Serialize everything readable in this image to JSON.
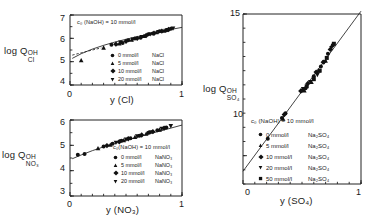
{
  "figure": {
    "ink_color": "#1a1a1a"
  },
  "panels": {
    "cl": {
      "ylabel_main": "log Q",
      "ylabel_sup": "OH",
      "ylabel_sub": "Cl",
      "xlabel": "y (Cl)",
      "annotation": "c₀ (NaOH)  =  10 mmol/l",
      "yticks": [
        "7",
        "6",
        "5",
        "4"
      ],
      "xticks": [
        "0",
        "1"
      ],
      "ylim": [
        4,
        7
      ],
      "xlim": [
        0,
        1
      ],
      "legend": [
        {
          "marker": "circle",
          "conc": "0 mmol/l",
          "salt": "NaCl"
        },
        {
          "marker": "triangle-up",
          "conc": "5 mmol/l",
          "salt": "NaCl"
        },
        {
          "marker": "diamond",
          "conc": "10 mmol/l",
          "salt": "NaCl"
        },
        {
          "marker": "triangle-down",
          "conc": "20 mmol/l",
          "salt": "NaCl"
        }
      ]
    },
    "no3": {
      "ylabel_main": "log Q",
      "ylabel_sup": "OH",
      "ylabel_sub": "NO₃",
      "xlabel": "y (NO₃)",
      "annotation": "c₀(NaOH)  =  10 mmol/l",
      "yticks": [
        "6",
        "5",
        "4",
        "3"
      ],
      "xticks": [
        "0",
        "1"
      ],
      "ylim": [
        3,
        6
      ],
      "xlim": [
        0,
        1
      ],
      "legend": [
        {
          "marker": "circle",
          "conc": "0 mmol/l",
          "salt": "NaNO₃"
        },
        {
          "marker": "triangle-up",
          "conc": "5 mmol/l",
          "salt": "NaNO₃"
        },
        {
          "marker": "diamond",
          "conc": "10 mmol/l",
          "salt": "NaNO₃"
        },
        {
          "marker": "triangle-down",
          "conc": "20 mmol/l",
          "salt": "NaNO₃"
        }
      ]
    },
    "so4": {
      "ylabel_main": "log Q",
      "ylabel_sup": "OH",
      "ylabel_sub": "SO₄",
      "xlabel": "y (SO₄)",
      "annotation": "c₀ (NaOH)  =  10 mmol/l",
      "yticks": [
        "15",
        "10"
      ],
      "xticks": [
        "0",
        "1"
      ],
      "ylim": [
        9,
        15
      ],
      "xlim": [
        0,
        1
      ],
      "legend": [
        {
          "marker": "circle",
          "conc": "0 mmol/l",
          "salt": "Na₂SO₄"
        },
        {
          "marker": "triangle-up",
          "conc": "5 mmol/l",
          "salt": "Na₂SO₄"
        },
        {
          "marker": "diamond",
          "conc": "10 mmol/l",
          "salt": "Na₂SO₄"
        },
        {
          "marker": "triangle-down",
          "conc": "20 mmol/l",
          "salt": "Na₂SO₄"
        },
        {
          "marker": "square",
          "conc": "50 mmol/l",
          "salt": "Na₂SO₄"
        }
      ]
    }
  },
  "chart_data": [
    {
      "type": "scatter",
      "id": "cl",
      "title": "",
      "xlabel": "y (Cl)",
      "ylabel": "log Q OH/Cl",
      "xlim": [
        0,
        1
      ],
      "ylim": [
        4,
        7
      ],
      "grid": false,
      "legend_position": "inside-lower-right",
      "annotation": "c0 (NaOH) = 10 mmol/l",
      "fit_line": {
        "type": "curve",
        "points": [
          [
            0.02,
            5.14
          ],
          [
            0.1,
            5.34
          ],
          [
            0.2,
            5.54
          ],
          [
            0.3,
            5.7
          ],
          [
            0.4,
            5.84
          ],
          [
            0.5,
            5.96
          ],
          [
            0.6,
            6.07
          ],
          [
            0.7,
            6.18
          ],
          [
            0.8,
            6.28
          ],
          [
            0.9,
            6.38
          ],
          [
            1.0,
            6.47
          ]
        ]
      },
      "dashed_segment": {
        "points": [
          [
            0.02,
            5.28
          ],
          [
            0.1,
            5.38
          ],
          [
            0.2,
            5.5
          ],
          [
            0.28,
            5.59
          ]
        ]
      },
      "series": [
        {
          "name": "0 mmol/l NaCl",
          "marker": "circle",
          "points": [
            [
              0.37,
              5.72
            ],
            [
              0.47,
              5.8
            ],
            [
              0.52,
              5.92
            ],
            [
              0.58,
              5.99
            ],
            [
              0.63,
              6.03
            ],
            [
              0.7,
              6.17
            ],
            [
              0.74,
              6.21
            ],
            [
              0.8,
              6.3
            ],
            [
              0.86,
              6.35
            ],
            [
              0.9,
              6.41
            ]
          ]
        },
        {
          "name": "5 mmol/l NaCl",
          "marker": "triangle-up",
          "points": [
            [
              0.1,
              5.06
            ],
            [
              0.3,
              5.6
            ],
            [
              0.44,
              5.78
            ],
            [
              0.55,
              5.94
            ],
            [
              0.66,
              6.1
            ],
            [
              0.77,
              6.26
            ],
            [
              0.84,
              6.33
            ]
          ]
        },
        {
          "name": "10 mmol/l NaCl",
          "marker": "diamond",
          "points": [
            [
              0.41,
              5.75
            ],
            [
              0.5,
              5.87
            ],
            [
              0.6,
              6.0
            ],
            [
              0.68,
              6.12
            ],
            [
              0.75,
              6.22
            ],
            [
              0.82,
              6.31
            ],
            [
              0.88,
              6.38
            ]
          ]
        },
        {
          "name": "20 mmol/l NaCl",
          "marker": "triangle-down",
          "points": [
            [
              0.45,
              5.82
            ],
            [
              0.56,
              5.95
            ],
            [
              0.64,
              6.06
            ],
            [
              0.72,
              6.18
            ],
            [
              0.79,
              6.27
            ],
            [
              0.87,
              6.36
            ],
            [
              0.92,
              6.42
            ]
          ]
        }
      ]
    },
    {
      "type": "scatter",
      "id": "no3",
      "title": "",
      "xlabel": "y (NO3)",
      "ylabel": "log Q OH/NO3",
      "xlim": [
        0,
        1
      ],
      "ylim": [
        3,
        6
      ],
      "grid": false,
      "legend_position": "inside-lower-right",
      "annotation": "c0(NaOH) = 10 mmol/l",
      "fit_line": {
        "type": "curve",
        "points": [
          [
            0.02,
            4.47
          ],
          [
            0.1,
            4.62
          ],
          [
            0.2,
            4.79
          ],
          [
            0.3,
            4.94
          ],
          [
            0.4,
            5.07
          ],
          [
            0.5,
            5.2
          ],
          [
            0.6,
            5.32
          ],
          [
            0.7,
            5.44
          ],
          [
            0.8,
            5.56
          ],
          [
            0.9,
            5.68
          ],
          [
            1.0,
            5.8
          ]
        ]
      },
      "series": [
        {
          "name": "0 mmol/l NaNO3",
          "marker": "circle",
          "points": [
            [
              0.07,
              4.63
            ],
            [
              0.13,
              4.66
            ],
            [
              0.3,
              4.95
            ],
            [
              0.38,
              5.06
            ],
            [
              0.46,
              5.18
            ],
            [
              0.54,
              5.28
            ],
            [
              0.62,
              5.38
            ],
            [
              0.7,
              5.5
            ],
            [
              0.78,
              5.6
            ],
            [
              0.86,
              5.7
            ]
          ]
        },
        {
          "name": "5 mmol/l NaNO3",
          "marker": "triangle-up",
          "points": [
            [
              0.25,
              4.88
            ],
            [
              0.36,
              5.02
            ],
            [
              0.48,
              5.2
            ],
            [
              0.58,
              5.33
            ],
            [
              0.68,
              5.46
            ],
            [
              0.8,
              5.62
            ]
          ]
        },
        {
          "name": "10 mmol/l NaNO3",
          "marker": "diamond",
          "points": [
            [
              0.33,
              4.99
            ],
            [
              0.44,
              5.14
            ],
            [
              0.52,
              5.26
            ],
            [
              0.64,
              5.41
            ],
            [
              0.74,
              5.54
            ],
            [
              0.84,
              5.68
            ]
          ]
        },
        {
          "name": "20 mmol/l NaNO3",
          "marker": "triangle-down",
          "points": [
            [
              0.41,
              5.1
            ],
            [
              0.5,
              5.23
            ],
            [
              0.6,
              5.36
            ],
            [
              0.72,
              5.52
            ],
            [
              0.82,
              5.65
            ],
            [
              0.9,
              5.76
            ]
          ]
        }
      ]
    },
    {
      "type": "scatter",
      "id": "so4",
      "title": "",
      "xlabel": "y (SO4)",
      "ylabel": "log Q OH/SO4",
      "xlim": [
        0,
        1
      ],
      "ylim": [
        9,
        15
      ],
      "grid": false,
      "legend_position": "inside-lower-left",
      "annotation": "c0 (NaOH) = 10 mmol/l",
      "fit_line": {
        "type": "line",
        "points": [
          [
            0.0,
            9.45
          ],
          [
            1.0,
            15.1
          ]
        ]
      },
      "series": [
        {
          "name": "0 mmol/l Na2SO4",
          "marker": "circle",
          "points": [
            [
              0.21,
              10.6
            ],
            [
              0.33,
              11.33
            ],
            [
              0.36,
              11.5
            ],
            [
              0.5,
              12.3
            ],
            [
              0.53,
              12.38
            ],
            [
              0.6,
              12.8
            ],
            [
              0.66,
              13.15
            ],
            [
              0.72,
              13.6
            ],
            [
              0.76,
              13.9
            ]
          ]
        },
        {
          "name": "5 mmol/l Na2SO4",
          "marker": "triangle-up",
          "points": [
            [
              0.34,
              11.3
            ],
            [
              0.52,
              12.3
            ],
            [
              0.58,
              12.6
            ],
            [
              0.64,
              13.0
            ],
            [
              0.7,
              13.35
            ]
          ]
        },
        {
          "name": "10 mmol/l Na2SO4",
          "marker": "diamond",
          "points": [
            [
              0.35,
              11.45
            ],
            [
              0.49,
              12.28
            ],
            [
              0.55,
              12.55
            ],
            [
              0.62,
              12.95
            ],
            [
              0.68,
              13.3
            ],
            [
              0.74,
              13.75
            ]
          ]
        },
        {
          "name": "20 mmol/l Na2SO4",
          "marker": "triangle-down",
          "points": [
            [
              0.51,
              12.35
            ],
            [
              0.57,
              12.6
            ],
            [
              0.63,
              12.85
            ],
            [
              0.69,
              13.3
            ],
            [
              0.75,
              13.8
            ]
          ]
        },
        {
          "name": "50 mmol/l Na2SO4",
          "marker": "square",
          "points": [
            [
              0.54,
              12.45
            ],
            [
              0.6,
              12.7
            ],
            [
              0.65,
              13.0
            ],
            [
              0.71,
              13.45
            ],
            [
              0.77,
              13.95
            ]
          ]
        }
      ]
    }
  ]
}
